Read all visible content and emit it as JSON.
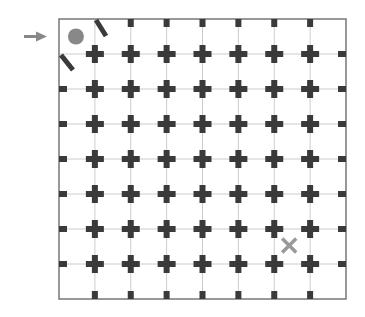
{
  "puzzle": {
    "grid": {
      "cols": 8,
      "rows": 8,
      "left": 59,
      "top": 19,
      "right": 346,
      "bottom": 299,
      "border_color": "#777777",
      "line_color": "#cccccc",
      "peg_color": "#3a3a3a"
    },
    "start_arrow": {
      "row": 0,
      "color": "#888888"
    },
    "player": {
      "shape": "circle",
      "col": 0,
      "row": 0,
      "color": "#888888"
    },
    "goal": {
      "shape": "x",
      "col": 6,
      "row": 6,
      "color": "#999999"
    },
    "diagonal_walls": [
      {
        "id": "wall-top",
        "x1": 96,
        "y1": 20,
        "x2": 106,
        "y2": 36
      },
      {
        "id": "wall-left",
        "x1": 61,
        "y1": 55,
        "x2": 73,
        "y2": 70
      }
    ]
  }
}
